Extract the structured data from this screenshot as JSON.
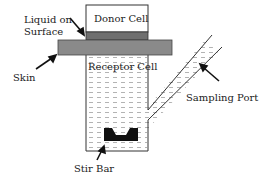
{
  "diagram": {
    "labels": {
      "donor_cell": "Donor Cell",
      "liquid_line1": "Liquid on",
      "liquid_line2": "Surface",
      "skin": "Skin",
      "receptor_cell": "Receptor Cell",
      "sampling_port": "Sampling Port",
      "stir_bar": "Stir Bar"
    },
    "colors": {
      "outline": "#333333",
      "skin": "#8a8a8a",
      "liquid": "#6f6f6f",
      "stir_bar": "#111111",
      "hatch": "#9a9a9a"
    }
  }
}
